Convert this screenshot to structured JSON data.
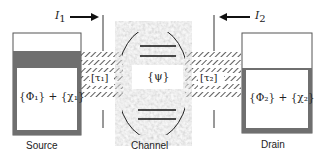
{
  "currents": {
    "left": {
      "symbol": "I",
      "subscript": "1",
      "direction": "right-arrow"
    },
    "right": {
      "symbol": "I",
      "subscript": "2",
      "direction": "left-arrow"
    }
  },
  "source": {
    "label": "Source",
    "content": "{Φ₁} + {χ₁}"
  },
  "drain": {
    "label": "Drain",
    "content": "{Φ₂} + {χ₂}"
  },
  "channel": {
    "label": "Channel",
    "content": "{ψ}"
  },
  "leads": {
    "left": "[τ₁]",
    "right": "[τ₂]"
  },
  "colors": {
    "border": "#555555",
    "gray_band": "#6f6f6f",
    "channel_texture": "#b5b5b5",
    "line": "#1a1a1a"
  }
}
